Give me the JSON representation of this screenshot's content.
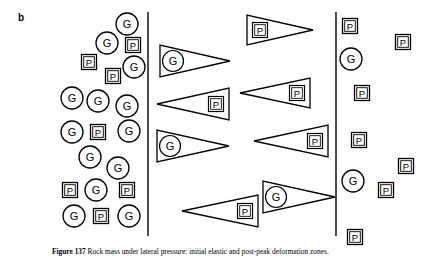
{
  "figure": {
    "panel_label": "b",
    "caption": "Figure 137   Rock mass under lateral pressure: initial elastic and post-peak deformation zones.",
    "caption_number": "Figure 137",
    "background_color": "#ffffff",
    "ink_color": "#000000"
  },
  "legend_symbols": {
    "circle_label": "G",
    "square_label": "P",
    "pennant_labels": [
      "G",
      "P"
    ]
  },
  "dividers": [
    {
      "name": "divider-left",
      "x": 148,
      "y1": 12,
      "y2": 236
    },
    {
      "name": "divider-right",
      "x": 336,
      "y1": 12,
      "y2": 236
    }
  ],
  "zones": [
    {
      "name": "zone-left",
      "x_range": [
        55,
        148
      ]
    },
    {
      "name": "zone-middle",
      "x_range": [
        148,
        336
      ]
    },
    {
      "name": "zone-right",
      "x_range": [
        336,
        429
      ]
    }
  ],
  "circles": [
    {
      "label": "G",
      "cx": 127,
      "cy": 24,
      "r": 11
    },
    {
      "label": "G",
      "cx": 107,
      "cy": 43,
      "r": 11
    },
    {
      "label": "G",
      "cx": 134,
      "cy": 67,
      "r": 11
    },
    {
      "label": "G",
      "cx": 72,
      "cy": 98,
      "r": 11
    },
    {
      "label": "G",
      "cx": 98,
      "cy": 101,
      "r": 11
    },
    {
      "label": "G",
      "cx": 127,
      "cy": 106,
      "r": 11
    },
    {
      "label": "G",
      "cx": 72,
      "cy": 132,
      "r": 11
    },
    {
      "label": "G",
      "cx": 129,
      "cy": 131,
      "r": 11
    },
    {
      "label": "G",
      "cx": 90,
      "cy": 157,
      "r": 11
    },
    {
      "label": "G",
      "cx": 118,
      "cy": 168,
      "r": 11
    },
    {
      "label": "G",
      "cx": 96,
      "cy": 190,
      "r": 11
    },
    {
      "label": "G",
      "cx": 74,
      "cy": 216,
      "r": 11
    },
    {
      "label": "G",
      "cx": 129,
      "cy": 216,
      "r": 11
    },
    {
      "label": "G",
      "cx": 351,
      "cy": 59,
      "r": 11
    },
    {
      "label": "G",
      "cx": 353,
      "cy": 181,
      "r": 11
    }
  ],
  "squares": [
    {
      "label": "P",
      "cx": 133,
      "cy": 45,
      "size": 15
    },
    {
      "label": "P",
      "cx": 89,
      "cy": 62,
      "size": 15
    },
    {
      "label": "P",
      "cx": 113,
      "cy": 76,
      "size": 15
    },
    {
      "label": "P",
      "cx": 98,
      "cy": 132,
      "size": 15
    },
    {
      "label": "P",
      "cx": 70,
      "cy": 190,
      "size": 15
    },
    {
      "label": "P",
      "cx": 127,
      "cy": 190,
      "size": 15
    },
    {
      "label": "P",
      "cx": 101,
      "cy": 216,
      "size": 15
    },
    {
      "label": "P",
      "cx": 350,
      "cy": 26,
      "size": 15
    },
    {
      "label": "P",
      "cx": 403,
      "cy": 42,
      "size": 15
    },
    {
      "label": "P",
      "cx": 362,
      "cy": 93,
      "size": 15
    },
    {
      "label": "P",
      "cx": 359,
      "cy": 140,
      "size": 15
    },
    {
      "label": "P",
      "cx": 406,
      "cy": 166,
      "size": 15
    },
    {
      "label": "P",
      "cx": 386,
      "cy": 190,
      "size": 15
    },
    {
      "label": "P",
      "cx": 355,
      "cy": 237,
      "size": 15
    }
  ],
  "pennants": [
    {
      "label": "G",
      "direction": "right",
      "x": 160,
      "y": 45,
      "width": 70,
      "height": 32
    },
    {
      "label": "P",
      "direction": "right",
      "x": 247,
      "y": 15,
      "width": 66,
      "height": 30
    },
    {
      "label": "P",
      "direction": "left",
      "x": 157,
      "y": 88,
      "width": 72,
      "height": 32
    },
    {
      "label": "P",
      "direction": "left",
      "x": 240,
      "y": 78,
      "width": 70,
      "height": 30
    },
    {
      "label": "G",
      "direction": "right",
      "x": 157,
      "y": 130,
      "width": 72,
      "height": 32
    },
    {
      "label": "P",
      "direction": "left",
      "x": 254,
      "y": 125,
      "width": 74,
      "height": 32
    },
    {
      "label": "P",
      "direction": "left",
      "x": 182,
      "y": 195,
      "width": 76,
      "height": 32
    },
    {
      "label": "G",
      "direction": "right",
      "x": 263,
      "y": 181,
      "width": 72,
      "height": 32
    }
  ]
}
